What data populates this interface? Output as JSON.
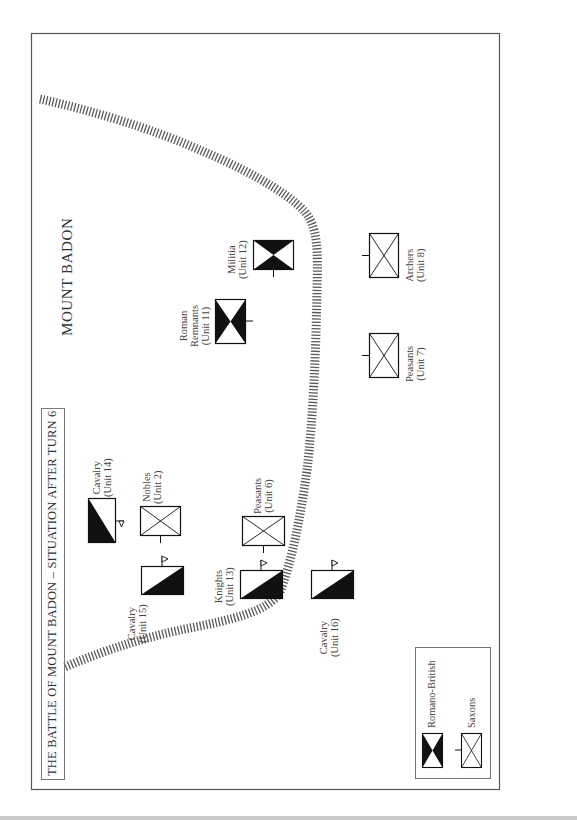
{
  "map": {
    "title": "THE BATTLE OF MOUNT BADON – SITUATION AFTER TURN 6",
    "terrain_label": "MOUNT BADON",
    "terrain_feature": "ridge-line",
    "colors": {
      "ink": "#1a1a1a",
      "frame": "#555555",
      "ridge": "#555555",
      "paper": "#ffffff"
    }
  },
  "units": [
    {
      "id": "u14",
      "name": "Cavalry",
      "unit": "(Unit 14)",
      "side": "Romano-British",
      "type": "cavalry"
    },
    {
      "id": "u2",
      "name": "Nobles",
      "unit": "(Unit 2)",
      "side": "Saxons",
      "type": "infantry"
    },
    {
      "id": "u15",
      "name": "Cavalry",
      "unit": "(Unit 15)",
      "side": "Romano-British",
      "type": "cavalry"
    },
    {
      "id": "u6",
      "name": "Peasants",
      "unit": "(Unit 6)",
      "side": "Saxons",
      "type": "infantry"
    },
    {
      "id": "u13",
      "name": "Knights",
      "unit": "(Unit 13)",
      "side": "Romano-British",
      "type": "cavalry"
    },
    {
      "id": "u16",
      "name": "Cavalry",
      "unit": "(Unit 16)",
      "side": "Romano-British",
      "type": "cavalry"
    },
    {
      "id": "u11",
      "name_line1": "Roman",
      "name_line2": "Remnants",
      "unit": "(Unit 11)",
      "side": "Romano-British",
      "type": "infantry"
    },
    {
      "id": "u12",
      "name": "Militia",
      "unit": "(Unit 12)",
      "side": "Romano-British",
      "type": "infantry"
    },
    {
      "id": "u7",
      "name": "Peasants",
      "unit": "(Unit 7)",
      "side": "Saxons",
      "type": "infantry"
    },
    {
      "id": "u8",
      "name": "Archers",
      "unit": "(Unit 8)",
      "side": "Saxons",
      "type": "infantry"
    }
  ],
  "legend": {
    "items": [
      {
        "label": "Romano-British",
        "icon": "romano-british-symbol"
      },
      {
        "label": "Saxons",
        "icon": "saxons-symbol"
      }
    ]
  }
}
